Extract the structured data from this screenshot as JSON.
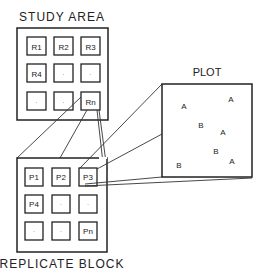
{
  "study_area": {
    "title": "STUDY AREA",
    "cells": [
      "R1",
      "R2",
      "R3",
      "R4",
      "·",
      "·",
      "·",
      "·",
      "Rn"
    ]
  },
  "replicate_block": {
    "title": "REPLICATE BLOCK",
    "cells": [
      "P1",
      "P2",
      "P3",
      "P4",
      "·",
      "·",
      "·",
      "·",
      "Pn"
    ]
  },
  "plot": {
    "title": "PLOT",
    "points": [
      {
        "label": "A",
        "x": 184,
        "y": 106
      },
      {
        "label": "A",
        "x": 231,
        "y": 99
      },
      {
        "label": "B",
        "x": 201,
        "y": 125
      },
      {
        "label": "A",
        "x": 223,
        "y": 132
      },
      {
        "label": "B",
        "x": 216,
        "y": 151
      },
      {
        "label": "A",
        "x": 232,
        "y": 161
      },
      {
        "label": "B",
        "x": 179,
        "y": 165
      }
    ]
  }
}
